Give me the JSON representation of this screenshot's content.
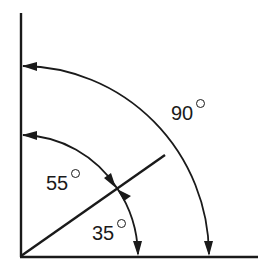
{
  "diagram": {
    "title": "",
    "labels": {
      "full_angle": "90",
      "upper_angle": "55",
      "lower_angle": "35"
    },
    "degree_symbol": "°",
    "angles_deg": {
      "full": 90,
      "upper": 55,
      "lower": 35
    },
    "colors": {
      "stroke": "#1a1a1a",
      "background": "#ffffff"
    }
  }
}
